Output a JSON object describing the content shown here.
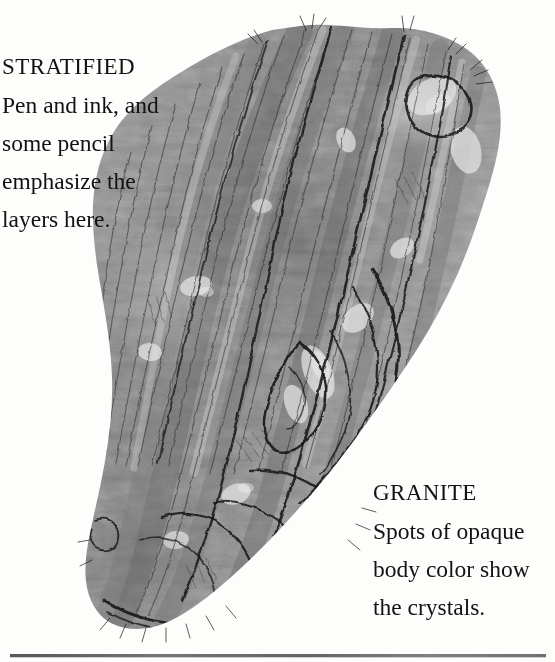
{
  "page": {
    "background_color": "#fdfdfc",
    "text_color": "#121212",
    "rule_color": "#4a4a4a"
  },
  "illustration": {
    "name": "rock-specimen-drawing",
    "description": "Grayscale pen-and-ink drawing of a layered rock specimen",
    "medium": "pen and ink with pencil and opaque body color",
    "tone_light": "#cfcfcf",
    "tone_mid": "#8d8d8d",
    "tone_dark": "#3c3c3c",
    "ink": "#1d1d1d"
  },
  "captions": {
    "stratified": {
      "title": "STRATIFIED",
      "lines": [
        "Pen and ink, and",
        "some pencil",
        "emphasize the",
        "layers here."
      ]
    },
    "granite": {
      "title": "GRANITE",
      "lines": [
        "Spots of opaque",
        "body color show",
        "the crystals."
      ]
    }
  }
}
